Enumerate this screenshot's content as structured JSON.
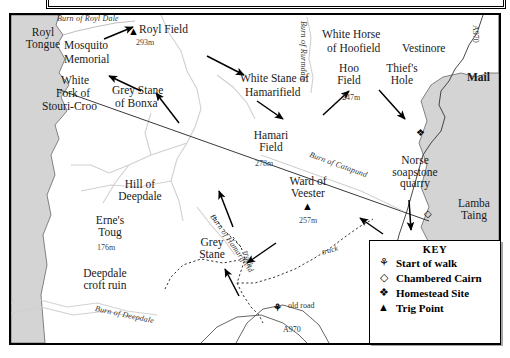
{
  "map": {
    "title_bar_text": "",
    "sea_fill": "#d4d4d4",
    "land_fill": "#ffffff",
    "line_color": "#000000",
    "stream_color": "#cfcfcf",
    "areas": [
      {
        "name": "Royl Tongue",
        "label": "Royl\nTongue"
      },
      {
        "name": "Lamba Taing",
        "label": "Lamba\nTaing"
      }
    ],
    "labels": {
      "royl_tongue_1": "Royl",
      "royl_tongue_2": "Tongue",
      "burn_of_royl_dale": "Burn of Royl Dale",
      "royl_field": "Royl Field",
      "royl_field_height": "293m",
      "mosquito_1": "Mosquito",
      "mosquito_2": "Memorial",
      "white_1": "White",
      "white_2": "Fork of",
      "white_3": "Stouri-Croo",
      "grey_stane_bonxa_1": "Grey Stane",
      "grey_stane_bonxa_2": "of Bonxa",
      "white_stane_1": "White Stane of",
      "white_stane_2": "Hamarifield",
      "burn_of_rurmdale": "Burn of Rurmdale",
      "white_horse_1": "White Horse",
      "white_horse_2": "of Hoofield",
      "hoo_field_1": "Hoo",
      "hoo_field_2": "Field",
      "hoo_field_height": "247m",
      "thiefs_1": "Thief's",
      "thiefs_2": "Hole",
      "vestinore": "Vestinore",
      "a970_top": "A970",
      "mail": "Mail",
      "hamari_1": "Hamari",
      "hamari_2": "Field",
      "hamari_height": "278m",
      "burn_of_catapund": "Burn of Catapund",
      "norse_1": "Norse",
      "norse_2": "soapstone",
      "norse_3": "quarry",
      "lamba_1": "Lamba",
      "lamba_2": "Taing",
      "hill_of_deepdale_1": "Hill of",
      "hill_of_deepdale_2": "Deepdale",
      "ward_of_veester_1": "Ward of",
      "ward_of_veester_2": "Veester",
      "ward_height": "257m",
      "ernes_toug_1": "Erne's",
      "ernes_toug_2": "Toug",
      "ernes_height": "176m",
      "grey_stane_1": "Grey",
      "grey_stane_2": "Stane",
      "burn_of_hamarifield": "Burn of Hamarifield",
      "deepdale_croft_1": "Deepdale",
      "deepdale_croft_2": "croft ruin",
      "burn_of_deepdale": "Burn of Deepdale",
      "track_left": "track",
      "track_right": "track",
      "old_road": "old road",
      "a970_bottom": "A970"
    },
    "markers": [
      {
        "name": "trig-royl-field",
        "type": "trig",
        "glyph": "▲"
      },
      {
        "name": "trig-ward-veester",
        "type": "trig",
        "glyph": "▲"
      },
      {
        "name": "homestead-norse",
        "type": "homestead",
        "glyph": "❖"
      },
      {
        "name": "cairn-coast",
        "type": "cairn",
        "glyph": "◇"
      },
      {
        "name": "start-of-walk",
        "type": "start",
        "glyph": "⚘"
      }
    ]
  },
  "key": {
    "title": "KEY",
    "items": [
      {
        "icon": "start-of-walk-icon",
        "glyph": "⚘",
        "label": "Start of walk"
      },
      {
        "icon": "chambered-cairn-icon",
        "glyph": "◇",
        "label": "Chambered Cairn"
      },
      {
        "icon": "homestead-site-icon",
        "glyph": "❖",
        "label": "Homestead Site"
      },
      {
        "icon": "trig-point-icon",
        "glyph": "▲",
        "label": "Trig Point"
      }
    ]
  }
}
